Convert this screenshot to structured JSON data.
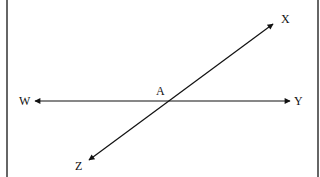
{
  "diagram": {
    "type": "intersecting-lines",
    "frame": {
      "left_x": 7,
      "right_x": 318,
      "color": "#333333"
    },
    "stroke_color": "#111111",
    "points": {
      "A": {
        "label": "A",
        "x": 160,
        "y": 93
      },
      "W": {
        "label": "W",
        "x": 27,
        "y": 105
      },
      "Y": {
        "label": "Y",
        "x": 298,
        "y": 105
      },
      "X": {
        "label": "X",
        "x": 286,
        "y": 22
      },
      "Z": {
        "label": "Z",
        "x": 79,
        "y": 169
      }
    },
    "lines": [
      {
        "name": "WY",
        "from": [
          35,
          101
        ],
        "to": [
          290,
          101
        ],
        "arrows": [
          "start",
          "end"
        ]
      },
      {
        "name": "ZX",
        "from": [
          89,
          160
        ],
        "to": [
          273,
          24
        ],
        "arrows": [
          "start",
          "end"
        ]
      }
    ],
    "intersection": {
      "label": "A",
      "x": 168,
      "y": 101
    }
  }
}
